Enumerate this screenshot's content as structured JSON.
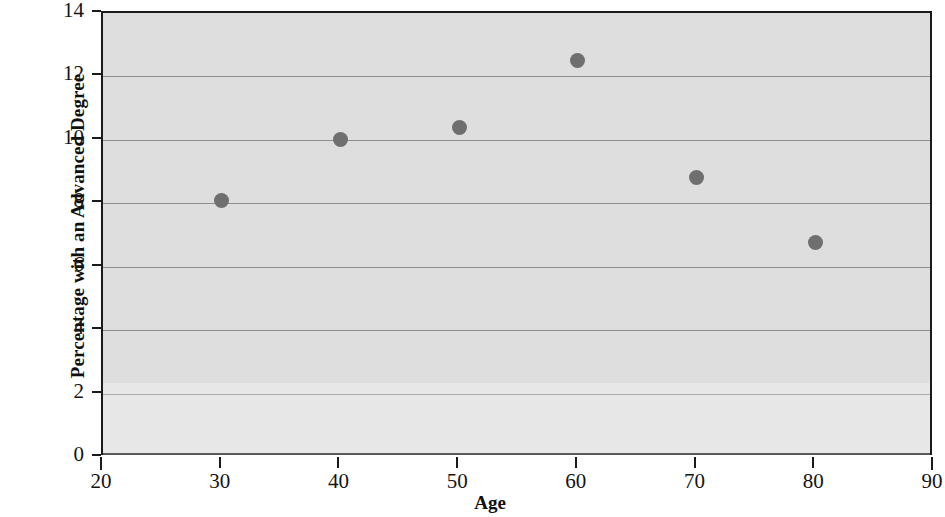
{
  "chart_data": {
    "type": "scatter",
    "title": "",
    "xlabel": "Age",
    "ylabel": "Percentage with an Advanced Degree",
    "xlim": [
      20,
      90
    ],
    "ylim": [
      0,
      14
    ],
    "xticks": [
      20,
      30,
      40,
      50,
      60,
      70,
      80,
      90
    ],
    "yticks": [
      0,
      2,
      4,
      6,
      8,
      10,
      12,
      14
    ],
    "xtick_labels": [
      "20",
      "30",
      "40",
      "50",
      "60",
      "70",
      "80",
      "90"
    ],
    "ytick_labels": [
      "0",
      "2",
      "4",
      "6",
      "8",
      "10",
      "12",
      "14"
    ],
    "grid": "horizontal",
    "legend": "none",
    "x": [
      30,
      40,
      50,
      60,
      70,
      80
    ],
    "values": [
      8.1,
      10.0,
      10.4,
      12.5,
      8.8,
      6.75
    ],
    "points": [
      {
        "x": 30,
        "y": 8.1
      },
      {
        "x": 40,
        "y": 10.0
      },
      {
        "x": 50,
        "y": 10.4
      },
      {
        "x": 60,
        "y": 12.5
      },
      {
        "x": 70,
        "y": 8.8
      },
      {
        "x": 80,
        "y": 6.75
      }
    ],
    "marker": "circle",
    "marker_color": "#6f6f6f",
    "plot_background": "#dedede",
    "gridline_color": "#8d8d8d",
    "axis_color": "#1a1a1a"
  }
}
